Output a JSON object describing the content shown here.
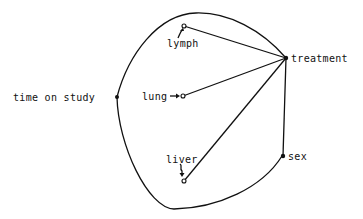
{
  "diagram": {
    "type": "graph",
    "background": "#ffffff",
    "line_color": "#111111",
    "nodes": [
      {
        "id": "time_on_study",
        "label": "time on study",
        "style": "filled"
      },
      {
        "id": "lymph",
        "label": "lymph",
        "style": "open"
      },
      {
        "id": "lung",
        "label": "lung",
        "style": "open"
      },
      {
        "id": "liver",
        "label": "liver",
        "style": "open"
      },
      {
        "id": "treatment",
        "label": "treatment",
        "style": "filled"
      },
      {
        "id": "sex",
        "label": "sex",
        "style": "filled"
      }
    ],
    "edges": [
      {
        "from": "lymph",
        "to": "treatment",
        "kind": "straight"
      },
      {
        "from": "lung",
        "to": "treatment",
        "kind": "straight"
      },
      {
        "from": "liver",
        "to": "treatment",
        "kind": "straight"
      },
      {
        "from": "treatment",
        "to": "sex",
        "kind": "straight"
      },
      {
        "from": "time_on_study",
        "to": "treatment",
        "kind": "curved"
      },
      {
        "from": "time_on_study",
        "to": "sex",
        "kind": "curved"
      }
    ],
    "annotations": [
      {
        "target": "lymph",
        "glyph": "curved-arrow-up"
      },
      {
        "target": "lung",
        "glyph": "arrow-right"
      },
      {
        "target": "liver",
        "glyph": "curved-arrow-down"
      }
    ]
  }
}
